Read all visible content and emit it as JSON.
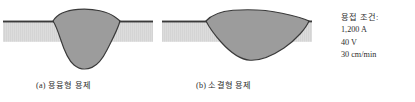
{
  "figure": {
    "background_color": "#ffffff",
    "plate": {
      "fill_color": "#d9d9d9",
      "edge_color": "#3a3a3a",
      "hatch": "vertical-fine-lines"
    },
    "bead": {
      "fill_color": "#9c9c9c",
      "outline_color": "#3a3a3a"
    }
  },
  "panels": [
    {
      "id": "panel-a",
      "caption": "(a) 용융형 용제",
      "bead_profile": "deep-narrow-v-penetration"
    },
    {
      "id": "panel-b",
      "caption": "(b) 소결형 용제",
      "bead_profile": "wide-shallow-lens"
    }
  ],
  "conditions": {
    "title": "용접 조건:",
    "lines": [
      "1,200 A",
      "40 V",
      "30 cm/min"
    ],
    "current": "1,200 A",
    "voltage": "40 V",
    "travel_speed": "30 cm/min"
  }
}
